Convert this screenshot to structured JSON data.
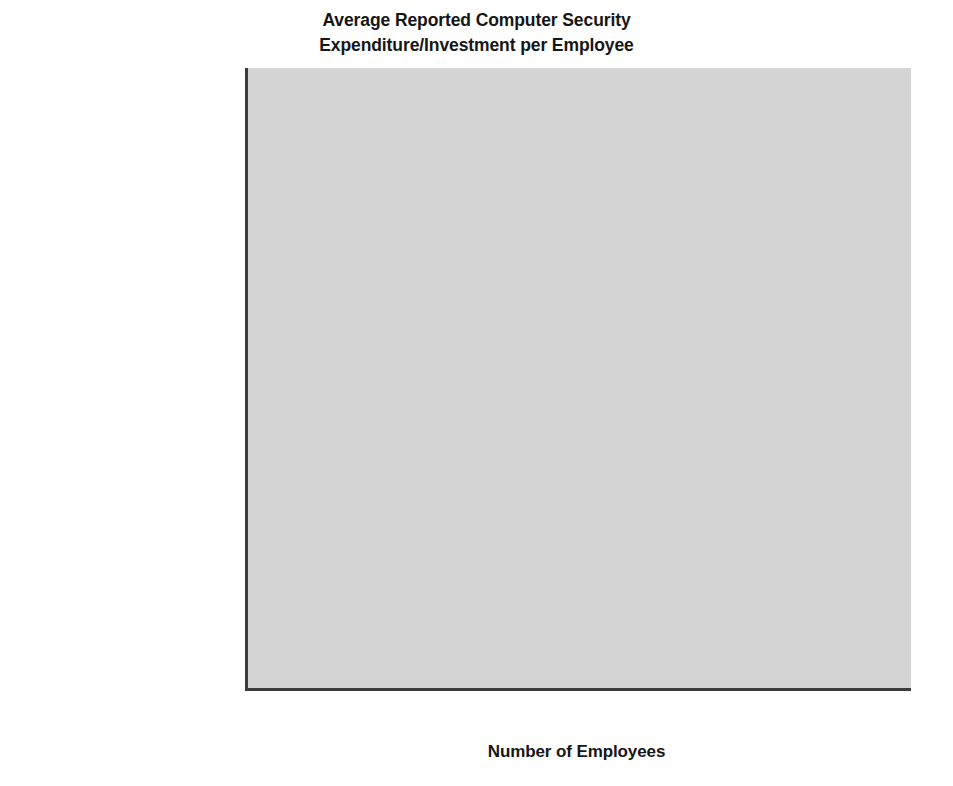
{
  "chart_data": {
    "type": "bar",
    "orientation": "horizontal",
    "title": "Average Reported Computer Security Expenditure/Investment per Employee",
    "title_lines": [
      "Average Reported Computer Security",
      "Expenditure/Investment per Employee"
    ],
    "xlabel": "Number of Employees",
    "ylabel": "",
    "xlim": [
      0,
      500
    ],
    "xticks": [
      0,
      50,
      100,
      150,
      200,
      250,
      300,
      350,
      400,
      450,
      500
    ],
    "xtick_labels": [
      "0",
      "50",
      "100",
      "150",
      "200",
      "250",
      "300",
      "350",
      "400",
      "450",
      "500"
    ],
    "grid": false,
    "legend_position": "center-right-inside",
    "categories": [
      "Transportation",
      "Federal government",
      "Telecommunications",
      "High-tech",
      "Financial",
      "State government",
      "Other",
      "Legal",
      "Utility",
      "Educational",
      "Manufacturing",
      "Local government",
      "Retail",
      "Medical"
    ],
    "series": [
      {
        "name": "Investment/employee",
        "color": "#7d7d7d",
        "values": [
          456,
          273,
          209,
          200,
          150,
          111,
          110,
          109,
          80,
          27,
          22,
          17,
          16,
          13
        ]
      },
      {
        "name": "Operating expense/employee",
        "color": "#bcbcbc",
        "values": [
          172,
          74,
          157,
          80,
          75,
          52,
          50,
          77,
          17,
          11,
          15,
          15,
          11,
          11
        ]
      }
    ]
  },
  "legend": {
    "items": [
      {
        "label": "Investment/employee",
        "swatch": "inv"
      },
      {
        "label": "Operating expense/employee",
        "swatch": "op"
      }
    ]
  },
  "colors": {
    "plot_background": "#d4d4d4",
    "investment_bar": "#7d7d7d",
    "operating_bar": "#bcbcbc",
    "axis": "#3b3b3b",
    "text": "#1a1a1a",
    "page_background": "#ffffff"
  }
}
